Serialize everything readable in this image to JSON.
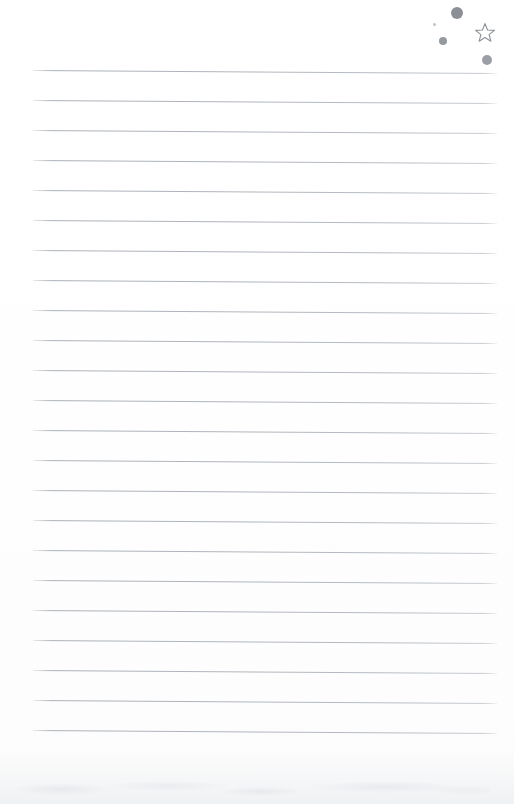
{
  "document": {
    "kind": "scanned-ruled-notepaper",
    "title": "Blank lined notepad page",
    "page_width": 514,
    "page_height": 804,
    "background_color": "#ffffff",
    "content_text": "",
    "is_blank": true
  },
  "ruled_lines": {
    "count": 23,
    "color": "#acb2b9",
    "thickness_px": 1,
    "first_line_y": 70,
    "line_spacing_px": 30,
    "left_x": 33,
    "right_x": 497,
    "tilt_degrees": 0.38,
    "ys": [
      70,
      100,
      130,
      160,
      190,
      220,
      250,
      280,
      310,
      340,
      370,
      400,
      430,
      460,
      490,
      520,
      550,
      580,
      610,
      640,
      670,
      700,
      730
    ]
  },
  "doodles": {
    "label": "ink dots and star cluster",
    "star": {
      "name": "star-outline",
      "x": 474,
      "y": 22,
      "size": 22,
      "color": "#8d9298",
      "filled": false
    },
    "dots": [
      {
        "name": "dot-large",
        "x": 451,
        "y": 7,
        "size": 12,
        "color": "#82878d"
      },
      {
        "name": "dot-tiny",
        "x": 433,
        "y": 23,
        "size": 3,
        "color": "#b4b9be"
      },
      {
        "name": "dot-medium",
        "x": 439,
        "y": 37,
        "size": 8,
        "color": "#8a8f95"
      },
      {
        "name": "dot-small",
        "x": 482,
        "y": 55,
        "size": 10,
        "color": "#8d9298"
      }
    ]
  },
  "bottom_edge": {
    "name": "scan-shadow",
    "description": "faint grey scanner shadow and paper smudge along bottom edge",
    "color": "#eef0f2"
  }
}
